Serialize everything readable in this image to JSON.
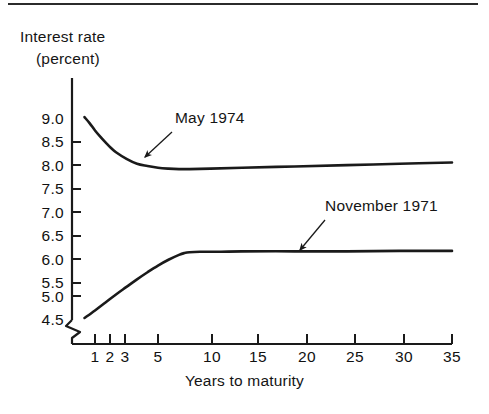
{
  "figure": {
    "has_top_rule": true,
    "background": "#ffffff",
    "ink_color": "#1a1a1a"
  },
  "chart_data": {
    "type": "line",
    "title": "",
    "subtitle": "",
    "xlabel": "Years to maturity",
    "ylabel": "Interest rate (percent)",
    "ylabel_lines": [
      "Interest rate",
      "(percent)"
    ],
    "grid": false,
    "legend_position": "inline-annotations",
    "axis_break_x": true,
    "axis_break_y": true,
    "xlim": [
      0,
      35
    ],
    "ylim": [
      4.5,
      9.25
    ],
    "xticks": [
      1,
      2,
      3,
      5,
      10,
      15,
      20,
      25,
      30,
      35
    ],
    "xticklabels": [
      "1",
      "2",
      "3",
      "5",
      "10",
      "15",
      "20",
      "25",
      "30",
      "35"
    ],
    "yticks": [
      9.0,
      8.5,
      8.0,
      7.5,
      7.0,
      6.5,
      6.0,
      5.5,
      5.0,
      4.5
    ],
    "yticklabels": [
      "9.0",
      "8.5",
      "8.0",
      "7.5",
      "7.0",
      "6.5",
      "6.0",
      "5.5",
      "5.0",
      "4.5"
    ],
    "series": [
      {
        "name": "May 1974",
        "color": "#1a1a1a",
        "x": [
          0.0,
          0.5,
          1.0,
          1.5,
          2.0,
          2.5,
          3.0,
          4.0,
          5.0,
          6.0,
          7.0,
          8.0,
          9.0,
          10.0,
          12.0,
          15.0,
          20.0,
          25.0,
          30.0,
          35.0
        ],
        "values": [
          9.02,
          8.88,
          8.72,
          8.58,
          8.45,
          8.33,
          8.23,
          8.08,
          7.97,
          7.92,
          7.88,
          7.86,
          7.85,
          7.85,
          7.86,
          7.88,
          7.91,
          7.94,
          7.97,
          8.0
        ]
      },
      {
        "name": "November 1971",
        "color": "#1a1a1a",
        "x": [
          0.0,
          1.0,
          2.0,
          3.0,
          4.0,
          5.0,
          6.0,
          7.0,
          8.0,
          9.0,
          9.5,
          10.0,
          11.0,
          13.0,
          15.0,
          20.0,
          25.0,
          30.0,
          35.0
        ],
        "values": [
          4.5,
          4.67,
          4.85,
          5.03,
          5.2,
          5.37,
          5.53,
          5.68,
          5.81,
          5.92,
          5.96,
          5.98,
          5.99,
          5.99,
          6.0,
          6.0,
          6.0,
          6.01,
          6.01
        ]
      }
    ],
    "annotations": [
      {
        "text": "May 1974",
        "label_x_px": 175,
        "label_y_px": 117,
        "arrow_from_px": [
          172,
          132
        ],
        "arrow_to_px": [
          145,
          157
        ]
      },
      {
        "text": "November 1971",
        "label_x_px": 325,
        "label_y_px": 205,
        "arrow_from_px": [
          325,
          220
        ],
        "arrow_to_px": [
          300,
          250
        ]
      }
    ]
  }
}
